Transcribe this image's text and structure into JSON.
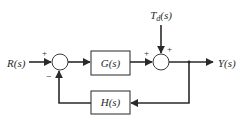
{
  "diagram": {
    "type": "control-system-block-diagram",
    "input_label": "R(s)",
    "output_label": "Y(s)",
    "disturbance": {
      "main": "T",
      "subscript": "d",
      "suffix": "(s)"
    },
    "blocks": {
      "forward": "G(s)",
      "feedback": "H(s)"
    },
    "summing_junction_1": {
      "top_sign": "+",
      "bottom_sign": "−"
    },
    "summing_junction_2": {
      "left_sign": "+",
      "top_sign": "+"
    },
    "colors": {
      "line": "#2a2a2a",
      "background": "#ffffff"
    }
  }
}
